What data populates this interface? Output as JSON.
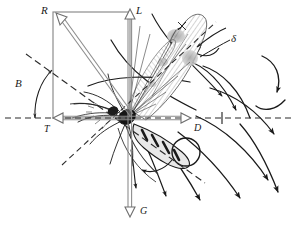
{
  "figure": {
    "kind": "scientific-line-diagram",
    "background_color": "#ffffff",
    "ink_color": "#1a1a1a",
    "construction_color": "#808080"
  },
  "labels": {
    "resultant": "R",
    "lift": "L",
    "thrust": "T",
    "drag": "D",
    "gravity": "G",
    "body_angle": "B",
    "stroke_angle": "δ"
  },
  "label_positions": {
    "resultant": {
      "x": 41,
      "y": 5
    },
    "lift": {
      "x": 134,
      "y": 5
    },
    "thrust": {
      "x": 42,
      "y": 125
    },
    "drag": {
      "x": 196,
      "y": 124
    },
    "gravity": {
      "x": 135,
      "y": 208
    },
    "body_angle": {
      "x": 16,
      "y": 78
    },
    "stroke_angle": {
      "x": 231,
      "y": 35
    }
  },
  "vectors": [
    {
      "name": "lift",
      "label": "L",
      "from": [
        130,
        118
      ],
      "to": [
        130,
        11
      ],
      "style": "solid-gray",
      "arrow": "open-up"
    },
    {
      "name": "gravity",
      "label": "G",
      "from": [
        130,
        118
      ],
      "to": [
        130,
        216
      ],
      "style": "solid-gray",
      "arrow": "open-down"
    },
    {
      "name": "thrust",
      "label": "T",
      "from": [
        130,
        118
      ],
      "to": [
        52,
        118
      ],
      "style": "solid-gray",
      "arrow": "open-left"
    },
    {
      "name": "drag",
      "label": "D",
      "from": [
        130,
        118
      ],
      "to": [
        192,
        118
      ],
      "style": "solid-gray",
      "arrow": "open-right"
    },
    {
      "name": "resultant",
      "label": "R",
      "from": [
        130,
        118
      ],
      "to": [
        54,
        12
      ],
      "style": "solid-gray",
      "arrow": "open-up-left"
    }
  ],
  "construction": {
    "rectangle": {
      "x": 53,
      "y": 12,
      "width": 77,
      "height": 106,
      "stroke": "#808080"
    },
    "note": "vector parallelogram for R between L and T"
  },
  "angle_arcs": [
    {
      "name": "body-angle-arc",
      "label": "B",
      "center": [
        22,
        118
      ],
      "radius": 46,
      "from_deg": 180,
      "to_deg": 208,
      "double_headed": true
    },
    {
      "name": "stroke-angle-arc",
      "label": "δ",
      "center": [
        225,
        45
      ],
      "radius": 30,
      "double_headed": true
    }
  ],
  "dashed_lines": [
    {
      "name": "horizontal-reference",
      "from": [
        5,
        118
      ],
      "to": [
        293,
        118
      ]
    },
    {
      "name": "flight-path-axis",
      "from": [
        26,
        54
      ],
      "to": [
        205,
        183
      ]
    },
    {
      "name": "stroke-plane-axis",
      "from": [
        62,
        163
      ],
      "to": [
        215,
        22
      ]
    }
  ],
  "streamlines": {
    "count": 12,
    "direction": "left-to-right over and around the insect",
    "arrowheads": "solid filled triangles",
    "vortices": [
      {
        "name": "leading-edge-vortex",
        "cx": 186,
        "cy": 42,
        "r": 15
      },
      {
        "name": "trailing-abdomen-vortex",
        "cx": 186,
        "cy": 152,
        "r": 14
      },
      {
        "name": "wake-curl",
        "cx": 272,
        "cy": 80,
        "r": 14
      }
    ]
  },
  "insect": {
    "name": "mosquito",
    "origin": [
      128,
      118
    ],
    "parts": [
      "head",
      "thorax",
      "abdomen",
      "forewing-hatched",
      "hindwing",
      "legs",
      "antennae"
    ],
    "wing_shading": "fine cross-hatching with stipple"
  }
}
